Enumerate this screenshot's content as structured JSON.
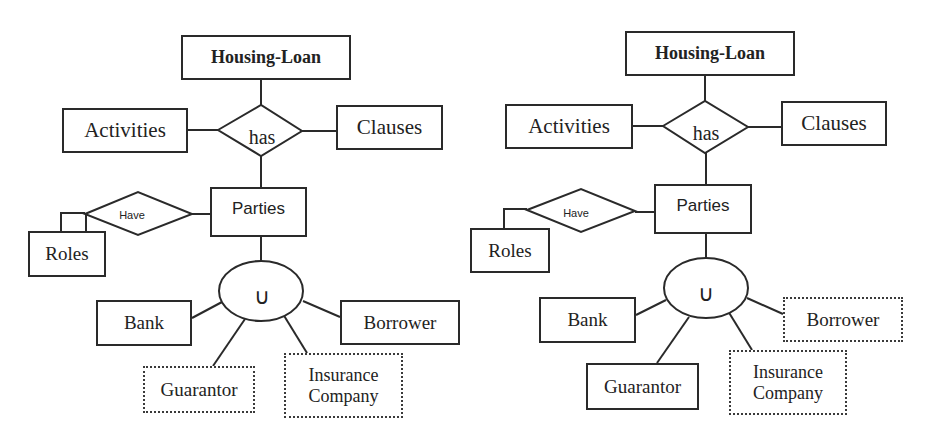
{
  "diagrams": [
    {
      "id": "left",
      "root": "Housing-Loan",
      "relationship": "has",
      "left_entity": "Activities",
      "right_entity": "Clauses",
      "child_entity": "Parties",
      "roles_relationship": "Have",
      "roles_entity": "Roles",
      "union_symbol": "∪",
      "subtypes": {
        "bank": "Bank",
        "borrower": "Borrower",
        "guarantor": "Guarantor",
        "insurance_line1": "Insurance",
        "insurance_line2": "Company"
      },
      "dotted_entities": [
        "Guarantor",
        "Insurance Company"
      ]
    },
    {
      "id": "right",
      "root": "Housing-Loan",
      "relationship": "has",
      "left_entity": "Activities",
      "right_entity": "Clauses",
      "child_entity": "Parties",
      "roles_relationship": "Have",
      "roles_entity": "Roles",
      "union_symbol": "∪",
      "subtypes": {
        "bank": "Bank",
        "borrower": "Borrower",
        "guarantor": "Guarantor",
        "insurance_line1": "Insurance",
        "insurance_line2": "Company"
      },
      "dotted_entities": [
        "Borrower",
        "Insurance Company"
      ]
    }
  ],
  "colors": {
    "line": "#2a2a2a",
    "text": "#222222",
    "background": "#ffffff"
  }
}
